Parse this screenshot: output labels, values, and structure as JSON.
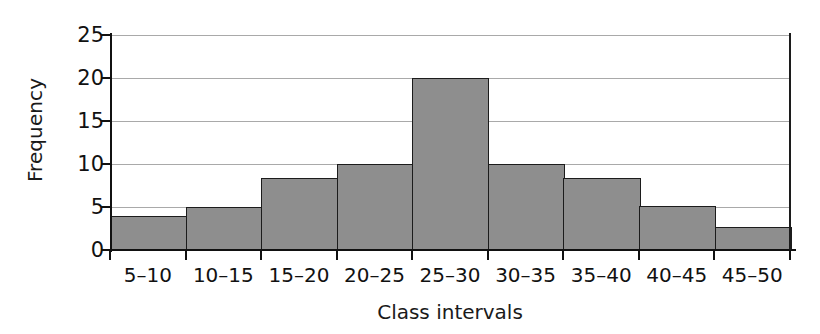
{
  "chart_data": {
    "type": "bar",
    "title": "",
    "xlabel": "Class intervals",
    "ylabel": "Frequency",
    "categories": [
      "5–10",
      "10–15",
      "15–20",
      "20–25",
      "25–30",
      "30–35",
      "35–40",
      "40–45",
      "45–50"
    ],
    "values": [
      4,
      5,
      8.4,
      10,
      20,
      10,
      8.4,
      5.1,
      2.7
    ],
    "ylim": [
      0,
      25
    ],
    "yticks": [
      0,
      5,
      10,
      15,
      20,
      25
    ],
    "ytick_labels": [
      "0",
      "5",
      "10",
      "15",
      "20",
      "25"
    ],
    "grid": true,
    "grid_axis": "y",
    "legend": "none",
    "bar_fill_color": "#8e8e8e",
    "bar_edge_color": "#1c1c1c",
    "gridline_color": "#a9a9a9",
    "axis_color": "#111111",
    "bars": [
      {
        "category": "5–10",
        "value": 4
      },
      {
        "category": "10–15",
        "value": 5
      },
      {
        "category": "15–20",
        "value": 8.4
      },
      {
        "category": "20–25",
        "value": 10
      },
      {
        "category": "25–30",
        "value": 20
      },
      {
        "category": "30–35",
        "value": 10
      },
      {
        "category": "35–40",
        "value": 8.4
      },
      {
        "category": "40–45",
        "value": 5.1
      },
      {
        "category": "45–50",
        "value": 2.7
      }
    ]
  }
}
